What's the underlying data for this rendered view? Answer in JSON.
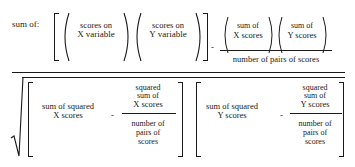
{
  "formula": {
    "prefix": "sum of:",
    "numerator": {
      "term1_line1": "scores on",
      "term1_line2": "X variable",
      "term2_line1": "scores on",
      "term2_line2": "Y variable",
      "minus": "-",
      "frac_top_a_line1": "sum of",
      "frac_top_a_line2": "X scores",
      "frac_top_b_line1": "sum of",
      "frac_top_b_line2": "Y scores",
      "frac_bottom": "number of pairs of scores"
    },
    "denominator": {
      "left": {
        "term_line1": "sum of squared",
        "term_line2": "X scores",
        "minus": "-",
        "frac_top_line1": "squared",
        "frac_top_line2": "sum of",
        "frac_top_line3": "X scores",
        "frac_bottom_line1": "number of",
        "frac_bottom_line2": "pairs of",
        "frac_bottom_line3": "scores"
      },
      "right": {
        "term_line1": "sum of squared",
        "term_line2": "Y scores",
        "minus": "-",
        "frac_top_line1": "squared",
        "frac_top_line2": "sum of",
        "frac_top_line3": "Y scores",
        "frac_bottom_line1": "number of",
        "frac_bottom_line2": "pairs of",
        "frac_bottom_line3": "scores"
      }
    }
  }
}
